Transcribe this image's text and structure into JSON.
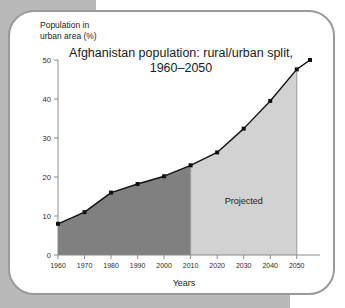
{
  "chart_data": {
    "type": "area",
    "title_line1": "Afghanistan population: rural/urban split,",
    "title_line2": "1960–2050",
    "xlabel": "Years",
    "ylabel": "Population in\nurban area (%)",
    "ylabel_line1": "Population in",
    "ylabel_line2": "urban area (%)",
    "x": [
      1960,
      1970,
      1980,
      1990,
      2000,
      2010,
      2020,
      2030,
      2040,
      2050
    ],
    "values": [
      8.0,
      11.0,
      16.0,
      18.2,
      20.2,
      23.0,
      26.3,
      32.4,
      39.5,
      47.6
    ],
    "xticklabels": [
      "1960",
      "1970",
      "1980",
      "1990",
      "2000",
      "2010",
      "2020",
      "2030",
      "2040",
      "2050"
    ],
    "yticklabels": [
      "0",
      "10",
      "20",
      "30",
      "40",
      "50"
    ],
    "yticks": [
      0,
      10,
      20,
      30,
      40,
      50
    ],
    "xlim": [
      1960,
      2055
    ],
    "ylim": [
      0,
      50
    ],
    "grid": false,
    "legend": "none",
    "annotations": [
      {
        "text": "Projected",
        "x": 2030,
        "y": 13
      }
    ],
    "regions": [
      {
        "name": "historical",
        "from": 1960,
        "to": 2010,
        "color": "#808080"
      },
      {
        "name": "projected",
        "from": 2010,
        "to": 2050,
        "color": "#d2d2d2"
      }
    ],
    "extension": {
      "to_x": 2055,
      "to_y": 50.0
    },
    "colors": {
      "historical_fill": "#808080",
      "projected_fill": "#d2d2d2",
      "line": "#111111",
      "marker": "#111111",
      "axis": "#8a8a8a",
      "page_background": "#b9b9b9",
      "card_background": "#ffffff",
      "card_border": "#9a9a9a"
    }
  }
}
